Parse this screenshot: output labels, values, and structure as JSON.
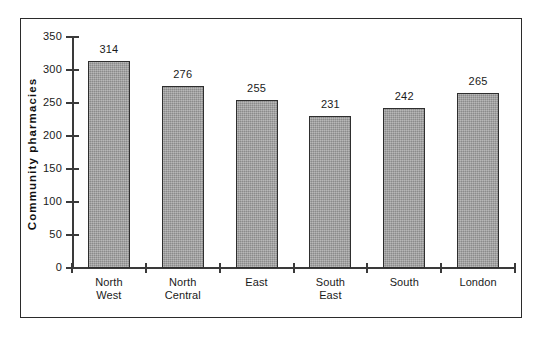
{
  "chart_data": {
    "type": "bar",
    "title": "",
    "xlabel": "",
    "ylabel": "Community  pharmacies",
    "categories": [
      "North West",
      "North Central",
      "East",
      "South East",
      "South",
      "London"
    ],
    "category_lines": [
      [
        "North",
        "West"
      ],
      [
        "North",
        "Central"
      ],
      [
        "East",
        ""
      ],
      [
        "South",
        "East"
      ],
      [
        "South",
        ""
      ],
      [
        "London",
        ""
      ]
    ],
    "values": [
      314,
      276,
      255,
      231,
      242,
      265
    ],
    "value_labels": [
      "314",
      "276",
      "255",
      "231",
      "242",
      "265"
    ],
    "ylim": [
      0,
      350
    ],
    "yticks": [
      0,
      50,
      100,
      150,
      200,
      250,
      300,
      350
    ],
    "ytick_labels": [
      "0",
      "50",
      "100",
      "150",
      "200",
      "250",
      "300",
      "350"
    ],
    "grid": false,
    "legend": false,
    "legend_position": "none",
    "bar_fill_color": "#9a9a9a",
    "bar_edge_color": "#2e2e2e",
    "axis_color": "#3a3a3a",
    "frame_color": "#2b2b2b",
    "background_color": "#ffffff"
  }
}
